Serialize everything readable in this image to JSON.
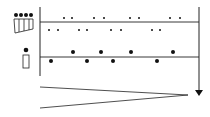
{
  "colors": {
    "stroke": "#222222",
    "fill": "#111111",
    "background": "#ffffff"
  },
  "axis": {
    "x": 40,
    "y_top": 7,
    "y_bottom": 76
  },
  "right_axis": {
    "x": 199,
    "y_top": 7,
    "y_bottom": 90,
    "arrow_head_y": 96
  },
  "group_icon": {
    "label": "group-of-four-performers",
    "heads": [
      [
        16,
        15
      ],
      [
        21,
        15
      ],
      [
        26,
        15
      ],
      [
        31,
        15
      ]
    ]
  },
  "single_icon": {
    "label": "single-performer",
    "head": [
      26,
      50
    ]
  },
  "upper_track": {
    "line_y": 22,
    "dots_above": {
      "y": 18,
      "xs": [
        64,
        72,
        94,
        104,
        130,
        139,
        170,
        180
      ]
    },
    "dots_below": {
      "y": 30,
      "xs": [
        49,
        58,
        79,
        87,
        111,
        121,
        152,
        160
      ]
    },
    "dot_radius": 1
  },
  "lower_track": {
    "line_y": 57,
    "dots_above": {
      "y": 52,
      "xs": [
        73,
        101,
        131,
        173
      ]
    },
    "dots_below": {
      "y": 61,
      "xs": [
        51,
        87,
        113,
        157
      ]
    },
    "dot_radius": 2
  },
  "wedge": {
    "top_start": [
      40,
      87
    ],
    "bottom_start": [
      40,
      108
    ],
    "apex": [
      188,
      95
    ]
  }
}
